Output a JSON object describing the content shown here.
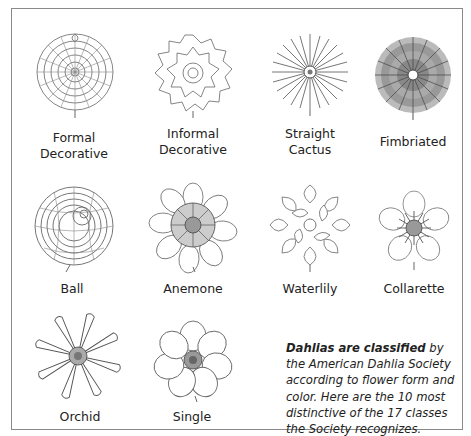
{
  "figure": {
    "flowers": [
      {
        "id": "formal-decorative",
        "label_line1": "Formal",
        "label_line2": "Decorative"
      },
      {
        "id": "informal-decorative",
        "label_line1": "Informal",
        "label_line2": "Decorative"
      },
      {
        "id": "straight-cactus",
        "label_line1": "Straight",
        "label_line2": "Cactus"
      },
      {
        "id": "fimbriated",
        "label_line1": "Fimbriated",
        "label_line2": ""
      },
      {
        "id": "ball",
        "label_line1": "Ball",
        "label_line2": ""
      },
      {
        "id": "anemone",
        "label_line1": "Anemone",
        "label_line2": ""
      },
      {
        "id": "waterlily",
        "label_line1": "Waterlily",
        "label_line2": ""
      },
      {
        "id": "collarette",
        "label_line1": "Collarette",
        "label_line2": ""
      },
      {
        "id": "orchid",
        "label_line1": "Orchid",
        "label_line2": ""
      },
      {
        "id": "single",
        "label_line1": "Single",
        "label_line2": ""
      }
    ],
    "caption": {
      "bold_lead": "Dahlias are classified",
      "body": " by the American Dahlia Society according to flower form and color. Here are the 10 most distinctive of the 17 classes the Society recognizes."
    },
    "colors": {
      "frame": "#8a8a8a",
      "ink": "#555555",
      "text": "#222222"
    }
  }
}
